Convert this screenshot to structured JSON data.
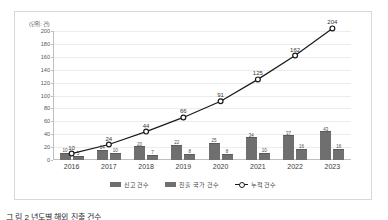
{
  "chart_data": {
    "type": "bar",
    "title": "",
    "unit_label": "(단위: 건)",
    "xlabel": "",
    "ylabel": "",
    "categories": [
      "2016",
      "2017",
      "2018",
      "2019",
      "2020",
      "2021",
      "2022",
      "2023"
    ],
    "ylim": [
      0,
      200
    ],
    "yticks": [
      0,
      20,
      40,
      60,
      80,
      100,
      120,
      140,
      160,
      180,
      200
    ],
    "grid": true,
    "legend_position": "bottom",
    "series": [
      {
        "name": "신고 건수",
        "type": "bar",
        "color": "#6f6f6f",
        "values": [
          10,
          14,
          20,
          22,
          25,
          34,
          37,
          43
        ],
        "labels": [
          "10",
          "14",
          "20",
          "22",
          "25",
          "34",
          "37",
          "43"
        ]
      },
      {
        "name": "진출 국가 건수",
        "type": "bar",
        "color": "#707070",
        "values": [
          5,
          10,
          7,
          8,
          8,
          10,
          16,
          16
        ],
        "labels": [
          "5",
          "10",
          "7",
          "8",
          "8",
          "10",
          "16",
          "16"
        ]
      },
      {
        "name": "누적 건수",
        "type": "line",
        "color": "#1a1a1a",
        "marker": "circle-open",
        "values": [
          10,
          24,
          44,
          66,
          91,
          125,
          162,
          204
        ],
        "labels": [
          "10",
          "24",
          "44",
          "66",
          "91",
          "125",
          "162",
          "204"
        ]
      }
    ]
  },
  "caption": "그 림 2 년도별 해외 진출 건수"
}
